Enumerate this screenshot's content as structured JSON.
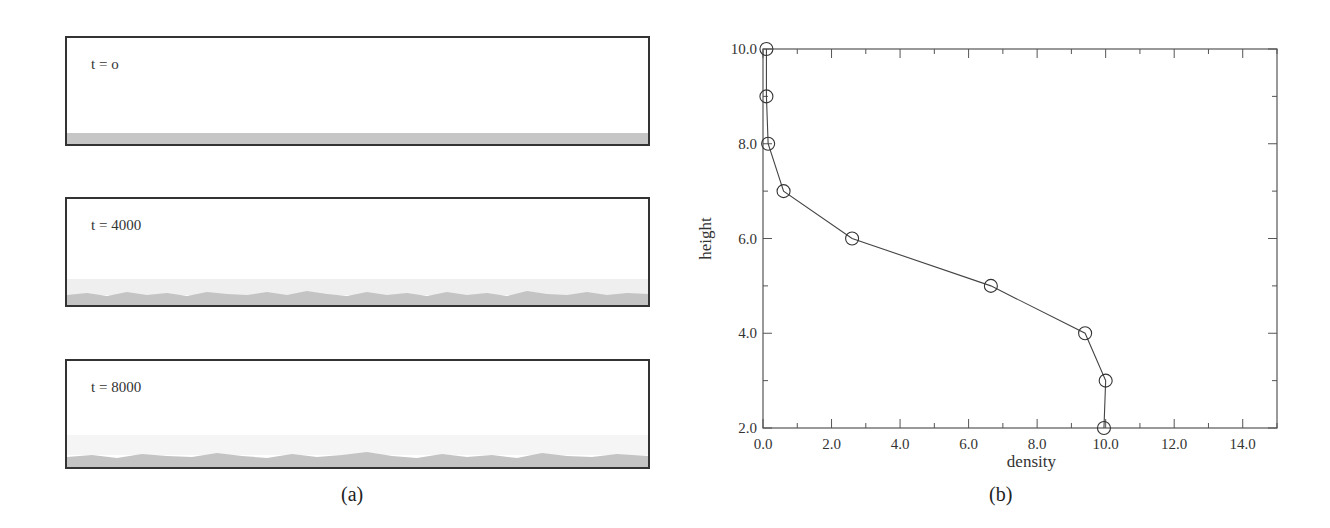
{
  "panel_a": {
    "label": "(a)",
    "snapshots": [
      {
        "label": "t = o",
        "time": 0
      },
      {
        "label": "t = 4000",
        "time": 4000
      },
      {
        "label": "t = 8000",
        "time": 8000
      }
    ]
  },
  "panel_b": {
    "label": "(b)"
  },
  "chart_data": {
    "type": "line",
    "title": "",
    "xlabel": "density",
    "ylabel": "height",
    "xlim": [
      0.0,
      15.0
    ],
    "ylim": [
      2.0,
      10.0
    ],
    "x_ticks": [
      "0.0",
      "2.0",
      "4.0",
      "6.0",
      "8.0",
      "10.0",
      "12.0",
      "14.0"
    ],
    "y_ticks": [
      "2.0",
      "4.0",
      "6.0",
      "8.0",
      "10.0"
    ],
    "grid": false,
    "marker": "open-circle",
    "series": [
      {
        "name": "density profile",
        "x": [
          0.1,
          0.1,
          0.15,
          0.6,
          2.6,
          6.65,
          9.4,
          10.0,
          9.95
        ],
        "y": [
          10.0,
          9.0,
          8.0,
          7.0,
          6.0,
          5.0,
          4.0,
          3.0,
          2.0
        ]
      }
    ]
  },
  "colors": {
    "sediment": "#c4c4c4",
    "frame": "#333333",
    "line": "#444444"
  }
}
